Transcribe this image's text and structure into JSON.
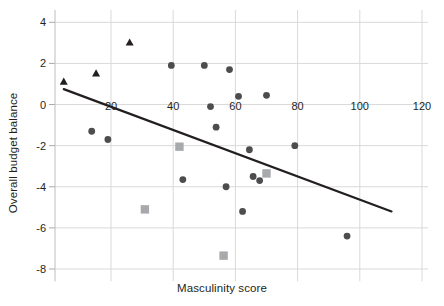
{
  "chart_data": {
    "type": "scatter",
    "title": "",
    "xlabel": "Masculinity score",
    "ylabel": "Overall budget balance",
    "xlim": [
      0,
      128
    ],
    "ylim": [
      -8.6,
      4.6
    ],
    "xticks": [
      20,
      40,
      60,
      80,
      100,
      120
    ],
    "yticks": [
      4,
      2,
      0,
      -2,
      -4,
      -6,
      -8
    ],
    "grid": true,
    "legend": "none",
    "series": [
      {
        "name": "triangle-group",
        "marker": "triangle",
        "color": "#231f20",
        "points": [
          {
            "x": 4.8,
            "y": 1.1
          },
          {
            "x": 15.2,
            "y": 1.5
          },
          {
            "x": 26.0,
            "y": 3.0
          }
        ]
      },
      {
        "name": "circle-group",
        "marker": "circle",
        "color": "#4d4d4f",
        "points": [
          {
            "x": 39.4,
            "y": 1.9
          },
          {
            "x": 50.0,
            "y": 1.9
          },
          {
            "x": 58.1,
            "y": 1.7
          },
          {
            "x": 61.0,
            "y": 0.4
          },
          {
            "x": 70.0,
            "y": 0.45
          },
          {
            "x": 52.0,
            "y": -0.1
          },
          {
            "x": 13.8,
            "y": -1.3
          },
          {
            "x": 19.0,
            "y": -1.7
          },
          {
            "x": 53.8,
            "y": -1.1
          },
          {
            "x": 64.5,
            "y": -2.2
          },
          {
            "x": 79.1,
            "y": -2.0
          },
          {
            "x": 43.1,
            "y": -3.65
          },
          {
            "x": 57.0,
            "y": -4.0
          },
          {
            "x": 65.7,
            "y": -3.5
          },
          {
            "x": 67.8,
            "y": -3.7
          },
          {
            "x": 62.3,
            "y": -5.2
          },
          {
            "x": 95.9,
            "y": -6.4
          }
        ]
      },
      {
        "name": "square-group",
        "marker": "square",
        "color": "#a7a9ac",
        "points": [
          {
            "x": 42.0,
            "y": -2.05
          },
          {
            "x": 30.9,
            "y": -5.1
          },
          {
            "x": 70.0,
            "y": -3.35
          },
          {
            "x": 56.2,
            "y": -7.35
          }
        ]
      }
    ],
    "trendline": {
      "name": "regression-line",
      "color": "#231f20",
      "x0": 4.8,
      "y0": 0.75,
      "x1": 110.2,
      "y1": -5.2
    }
  }
}
